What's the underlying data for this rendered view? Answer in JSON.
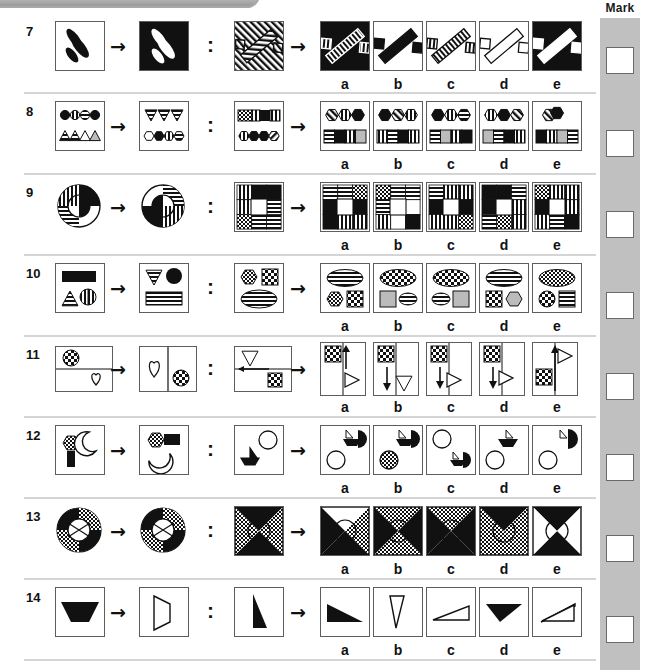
{
  "page": {
    "mark_column_label": "Mark",
    "option_labels": [
      "a",
      "b",
      "c",
      "d",
      "e"
    ],
    "separator_color": "#d5d5d5",
    "mark_strip_color": "#c0c0c0",
    "ink_color": "#111111",
    "panel_border_color": "#5d5d5d",
    "arrow_glyph": "→",
    "colon_glyph": ":"
  },
  "questions": [
    {
      "number": "7",
      "stem_a": "three black diagonal ellipses on white square",
      "stem_b": "three white diagonal ellipses on black square",
      "stem_c": "hatched square with two small diamonds flanking a wide diagonal bar",
      "options": [
        {
          "label": "a",
          "desc": "black square, white striped diagonal bar with two small striped diamonds"
        },
        {
          "label": "b",
          "desc": "white square, solid black diagonal bar with two black diamonds"
        },
        {
          "label": "c",
          "desc": "white square, striped diagonal bar with two striped diamonds"
        },
        {
          "label": "d",
          "desc": "white square, outline striped bar with two outline diamonds"
        },
        {
          "label": "e",
          "desc": "black square, white diagonal bar with two white diamonds"
        }
      ]
    },
    {
      "number": "8",
      "stem_a": "row of four patterned circles above row of four triangles",
      "stem_b": "row of three triangles above row of four patterned hexagons",
      "stem_c": "striped bar band above row of four patterned hexagons",
      "options": [
        {
          "label": "a",
          "desc": "three hexagons above banded bar"
        },
        {
          "label": "b",
          "desc": "three hexagons above banded bar variant"
        },
        {
          "label": "c",
          "desc": "three hexagons above banded bar variant"
        },
        {
          "label": "d",
          "desc": "three hexagons above banded bar variant"
        },
        {
          "label": "e",
          "desc": "two overlapping hexagons above banded bar"
        }
      ]
    },
    {
      "number": "9",
      "stem_a": "large circle with striped and black quadrant rings",
      "stem_b": "circle with rotated striped and black quadrants",
      "stem_c": "square grid of striped, black, dotted and white blocks",
      "options": [
        {
          "label": "a",
          "desc": "block grid rotation variant a"
        },
        {
          "label": "b",
          "desc": "block grid rotation variant b"
        },
        {
          "label": "c",
          "desc": "block grid rotation variant c"
        },
        {
          "label": "d",
          "desc": "block grid rotation variant d"
        },
        {
          "label": "e",
          "desc": "block grid rotation variant e"
        }
      ]
    },
    {
      "number": "10",
      "stem_a": "black bar above a striped triangle and striped circle",
      "stem_b": "striped triangle and black ellipse above striped bar",
      "stem_c": "dotted hexagon and checked square above striped ellipse",
      "options": [
        {
          "label": "a",
          "desc": "striped ellipse above hexagon and checked square"
        },
        {
          "label": "b",
          "desc": "checked ellipse above square and striped ellipse"
        },
        {
          "label": "c",
          "desc": "checked ellipse above striped ellipse and grey square"
        },
        {
          "label": "d",
          "desc": "striped ellipse above checked square and hexagon"
        },
        {
          "label": "e",
          "desc": "dotted ellipse above checked circle and striped square"
        }
      ]
    },
    {
      "number": "11",
      "stem_a": "checkered circle top cell, heart outline bottom cell",
      "stem_b": "heart outline left cell, checkered circle right cell",
      "stem_c": "triangle outline and left arrow left, checkered square right",
      "options": [
        {
          "label": "a",
          "desc": "checkered square with up arrow, triangle right"
        },
        {
          "label": "b",
          "desc": "checkered square, down arrow and triangle"
        },
        {
          "label": "c",
          "desc": "checkered square, down arrow, triangle right"
        },
        {
          "label": "d",
          "desc": "checkered square, down arrow, triangle right variant"
        },
        {
          "label": "e",
          "desc": "up arrow and triangle top, checkered square left"
        }
      ]
    },
    {
      "number": "12",
      "stem_a": "dotted hexagon on black stem, crescent moon",
      "stem_b": "dotted hexagon with black bar, crescent moon below",
      "stem_c": "small boat shape and circle outline",
      "options": [
        {
          "label": "a",
          "desc": "boat with black half disc, circle outline below"
        },
        {
          "label": "b",
          "desc": "boat with black half disc, dotted circle below"
        },
        {
          "label": "c",
          "desc": "circle outline above, small boat with black half disc"
        },
        {
          "label": "d",
          "desc": "black boat shape above circle outline"
        },
        {
          "label": "e",
          "desc": "boat with black half disc, circle outline below variant"
        }
      ]
    },
    {
      "number": "13",
      "stem_a": "circle with black and dotted hourglass segments",
      "stem_b": "circle with rotated black and dotted segments",
      "stem_c": "square with black and dotted triangular quadrants and circle",
      "options": [
        {
          "label": "a",
          "desc": "square quadrant variant a"
        },
        {
          "label": "b",
          "desc": "square quadrant variant b"
        },
        {
          "label": "c",
          "desc": "square quadrant variant c"
        },
        {
          "label": "d",
          "desc": "square quadrant variant d"
        },
        {
          "label": "e",
          "desc": "square quadrant variant e"
        }
      ]
    },
    {
      "number": "14",
      "stem_a": "black trapezoid pointing down",
      "stem_b": "outline trapezoid pointing right",
      "stem_c": "black tall right triangle",
      "options": [
        {
          "label": "a",
          "desc": "black triangle pointing right-down"
        },
        {
          "label": "b",
          "desc": "narrow outline triangle"
        },
        {
          "label": "c",
          "desc": "flat outline triangle"
        },
        {
          "label": "d",
          "desc": "black flat triangle"
        },
        {
          "label": "e",
          "desc": "flat outline triangle variant"
        }
      ]
    }
  ]
}
